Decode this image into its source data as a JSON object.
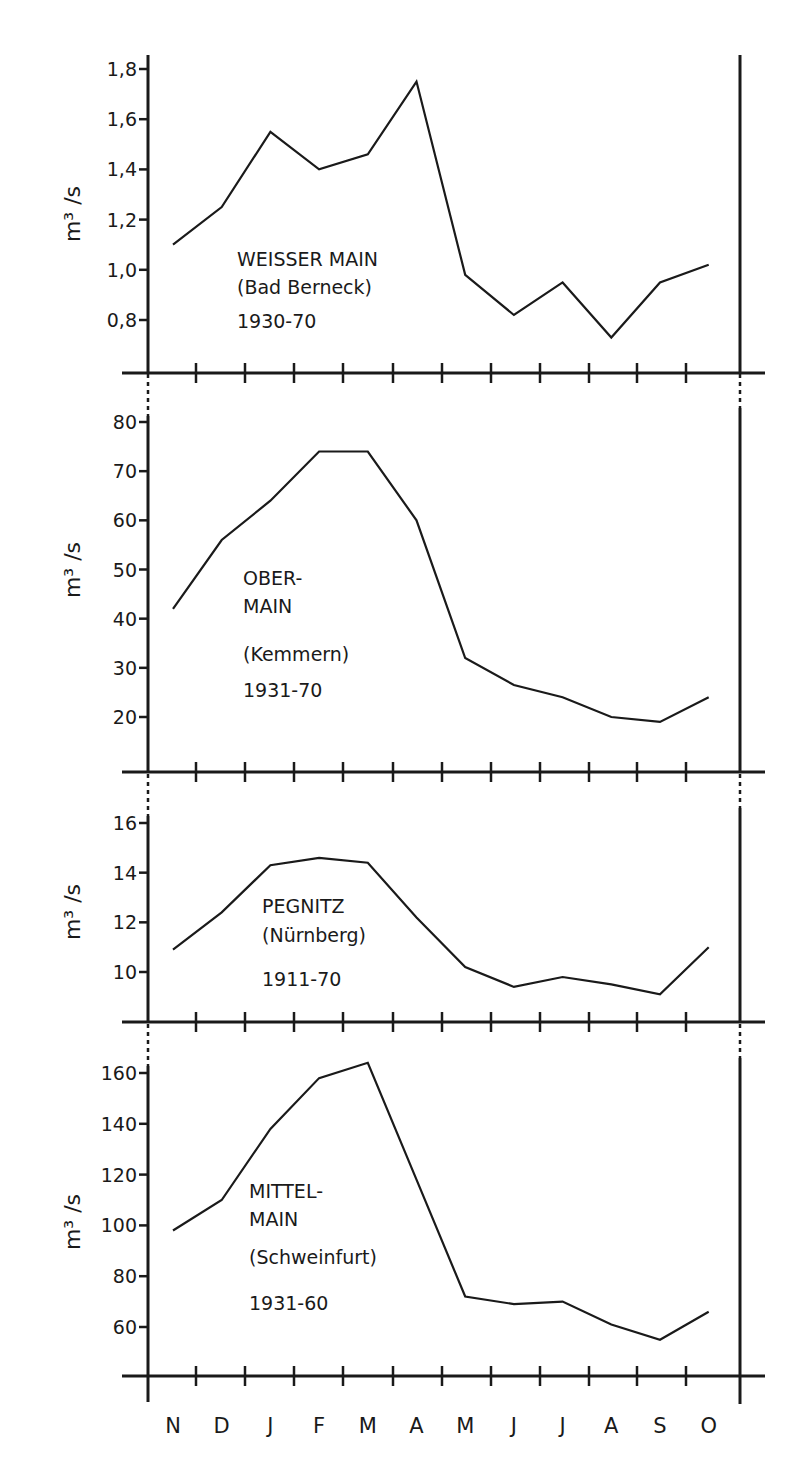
{
  "chart_data": [
    {
      "type": "line",
      "title": "WEISSER MAIN (Bad Berneck) 1930-70",
      "label_lines": [
        "WEISSER MAIN",
        "(Bad Berneck)",
        "1930-70"
      ],
      "xlabel": "",
      "ylabel": "m³ /s",
      "categories": [
        "N",
        "D",
        "J",
        "F",
        "M",
        "A",
        "M",
        "J",
        "J",
        "A",
        "S",
        "O"
      ],
      "values": [
        1.1,
        1.25,
        1.55,
        1.4,
        1.46,
        1.75,
        0.98,
        0.82,
        0.95,
        0.73,
        0.95,
        1.02
      ],
      "yticks": [
        0.8,
        1.0,
        1.2,
        1.4,
        1.6,
        1.8
      ],
      "ytick_labels": [
        "0,8",
        "1,0",
        "1,2",
        "1,4",
        "1,6",
        "1,8"
      ],
      "ylim": [
        0.59,
        1.8
      ],
      "grid": false
    },
    {
      "type": "line",
      "title": "OBER-MAIN (Kemmern) 1931-70",
      "label_lines": [
        "OBER-",
        "MAIN",
        "(Kemmern)",
        "1931-70"
      ],
      "xlabel": "",
      "ylabel": "m³ /s",
      "categories": [
        "N",
        "D",
        "J",
        "F",
        "M",
        "A",
        "M",
        "J",
        "J",
        "A",
        "S",
        "O"
      ],
      "values": [
        42,
        56,
        64,
        74,
        74,
        60,
        32,
        26.5,
        24,
        20,
        19,
        24
      ],
      "yticks": [
        20,
        30,
        40,
        50,
        60,
        70,
        80
      ],
      "ytick_labels": [
        "20",
        "30",
        "40",
        "50",
        "60",
        "70",
        "80"
      ],
      "ylim": [
        9,
        80
      ],
      "grid": false
    },
    {
      "type": "line",
      "title": "PEGNITZ (Nürnberg) 1911-70",
      "label_lines": [
        "PEGNITZ",
        "(Nürnberg)",
        "1911-70"
      ],
      "xlabel": "",
      "ylabel": "m³ /s",
      "categories": [
        "N",
        "D",
        "J",
        "F",
        "M",
        "A",
        "M",
        "J",
        "J",
        "A",
        "S",
        "O"
      ],
      "values": [
        10.9,
        12.4,
        14.3,
        14.6,
        14.4,
        12.2,
        10.2,
        9.4,
        9.8,
        9.5,
        9.1,
        11.0
      ],
      "yticks": [
        10,
        12,
        14,
        16
      ],
      "ytick_labels": [
        "10",
        "12",
        "14",
        "16"
      ],
      "ylim": [
        8,
        16
      ],
      "grid": false
    },
    {
      "type": "line",
      "title": "MITTEL-MAIN (Schweinfurt) 1931-60",
      "label_lines": [
        "MITTEL-",
        "MAIN",
        "(Schweinfurt)",
        "1931-60"
      ],
      "xlabel": "",
      "ylabel": "m³ /s",
      "categories": [
        "N",
        "D",
        "J",
        "F",
        "M",
        "A",
        "M",
        "J",
        "J",
        "A",
        "S",
        "O"
      ],
      "values": [
        98,
        110,
        138,
        158,
        164,
        118,
        72,
        69,
        70,
        61,
        55,
        66
      ],
      "yticks": [
        60,
        80,
        100,
        120,
        140,
        160
      ],
      "ytick_labels": [
        "60",
        "80",
        "100",
        "120",
        "140",
        "160"
      ],
      "ylim": [
        40,
        160
      ],
      "grid": false
    }
  ],
  "x_axis": {
    "month_labels": [
      "N",
      "D",
      "J",
      "F",
      "M",
      "A",
      "M",
      "J",
      "J",
      "A",
      "S",
      "O"
    ]
  },
  "colors": {
    "ink": "#1a1a1a",
    "background": "#ffffff"
  }
}
